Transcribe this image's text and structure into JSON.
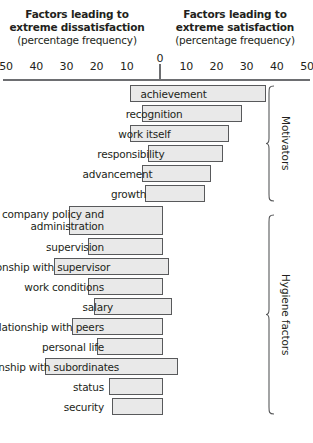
{
  "headers": {
    "left_line1": "Factors leading to",
    "left_line2": "extreme dissatisfaction",
    "left_line3": "(percentage frequency)",
    "right_line1": "Factors leading to",
    "right_line2": "extreme satisfaction",
    "right_line3": "(percentage frequency)"
  },
  "axis": {
    "zero": "0",
    "left_ticks": [
      "50",
      "40",
      "30",
      "20",
      "10"
    ],
    "right_ticks": [
      "10",
      "20",
      "30",
      "40",
      "50"
    ]
  },
  "groups": {
    "motivators": "Motivators",
    "hygiene": "Hygiene factors"
  },
  "colors": {
    "bar_fill": "#e9e9e9",
    "bar_stroke": "#58595b",
    "axis": "#6d6e71",
    "text": "#231f20"
  },
  "chart_data": {
    "type": "bar",
    "orientation": "horizontal-diverging",
    "xlabel": "percentage frequency",
    "ylabel": "",
    "xlim": [
      -50,
      50
    ],
    "xticks": [
      -50,
      -40,
      -30,
      -20,
      -10,
      0,
      10,
      20,
      30,
      40,
      50
    ],
    "grid": false,
    "legend": false,
    "series": [
      {
        "name": "Factors leading to extreme dissatisfaction",
        "side": "left"
      },
      {
        "name": "Factors leading to extreme satisfaction",
        "side": "right"
      }
    ],
    "groups": [
      {
        "name": "Motivators",
        "items": [
          {
            "label": "achievement",
            "dissatisfaction": 10,
            "satisfaction": 35
          },
          {
            "label": "recognition",
            "dissatisfaction": 6,
            "satisfaction": 27
          },
          {
            "label": "work itself",
            "dissatisfaction": 10,
            "satisfaction": 23
          },
          {
            "label": "responsibility",
            "dissatisfaction": 4,
            "satisfaction": 21
          },
          {
            "label": "advancement",
            "dissatisfaction": 6,
            "satisfaction": 17
          },
          {
            "label": "growth",
            "dissatisfaction": 5,
            "satisfaction": 15
          }
        ]
      },
      {
        "name": "Hygiene factors",
        "items": [
          {
            "label": "company policy and administration",
            "dissatisfaction": 30,
            "satisfaction": 1
          },
          {
            "label": "supervision",
            "dissatisfaction": 24,
            "satisfaction": 1
          },
          {
            "label": "relationship with supervisor",
            "dissatisfaction": 35,
            "satisfaction": 3
          },
          {
            "label": "work conditions",
            "dissatisfaction": 24,
            "satisfaction": 1
          },
          {
            "label": "salary",
            "dissatisfaction": 22,
            "satisfaction": 4
          },
          {
            "label": "relationship with peers",
            "dissatisfaction": 29,
            "satisfaction": 1
          },
          {
            "label": "personal life",
            "dissatisfaction": 21,
            "satisfaction": 1
          },
          {
            "label": "relationship with subordinates",
            "dissatisfaction": 38,
            "satisfaction": 6
          },
          {
            "label": "status",
            "dissatisfaction": 17,
            "satisfaction": 1
          },
          {
            "label": "security",
            "dissatisfaction": 16,
            "satisfaction": 1
          }
        ]
      }
    ]
  }
}
